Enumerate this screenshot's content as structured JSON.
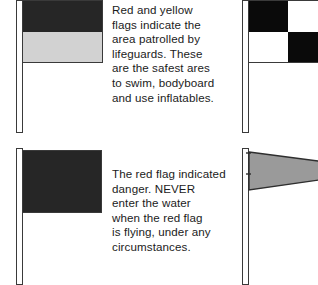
{
  "figure": {
    "background_color": "#ffffff",
    "width": 318,
    "height": 285
  },
  "palette": {
    "red_dark": "#262626",
    "yellow_light": "#d2d2d2",
    "black": "#0a0a0a",
    "white": "#ffffff",
    "gray_pennant": "#9a9a9a",
    "outline": "#3a3a3a",
    "text": "#1b1b1b"
  },
  "items": [
    {
      "id": "red-yellow-flag",
      "flag_name": "Red and yellow flag",
      "icon_name": "red-yellow-flag-icon",
      "bands": [
        {
          "label": "red band",
          "color": "#262626"
        },
        {
          "label": "yellow band",
          "color": "#d2d2d2"
        }
      ],
      "caption": "Red and yellow\nflags indicate the\narea patrolled by\nlifeguards. These\nare the safest ares\nto swim, bodyboard\nand use inflatables."
    },
    {
      "id": "red-flag",
      "flag_name": "Red flag",
      "icon_name": "red-flag-icon",
      "bands": [
        {
          "label": "red field",
          "color": "#262626"
        }
      ],
      "caption": "The red flag indicated\ndanger. NEVER\nenter the water\nwhen the red flag\nis flying, under any\ncircumstances."
    },
    {
      "id": "black-white-chequered-flag",
      "flag_name": "Black and white chequered flag",
      "icon_name": "chequered-flag-icon",
      "cells": [
        {
          "label": "top-left",
          "color": "#0a0a0a"
        },
        {
          "label": "top-right",
          "color": "#ffffff"
        },
        {
          "label": "bottom-left",
          "color": "#ffffff"
        },
        {
          "label": "bottom-right",
          "color": "#0a0a0a"
        }
      ],
      "caption": ""
    },
    {
      "id": "orange-windsock-pennant",
      "flag_name": "Orange windsock pennant",
      "icon_name": "windsock-pennant-icon",
      "cells": [
        {
          "label": "pennant body",
          "color": "#9a9a9a"
        }
      ],
      "caption": ""
    }
  ]
}
